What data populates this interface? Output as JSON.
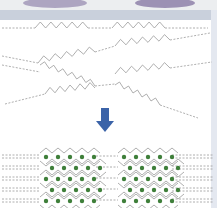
{
  "figure": {
    "title": "",
    "stages": [
      {
        "name": "amorphous-chains",
        "description": "disordered zigzag polymer chains"
      },
      {
        "name": "ordered-structure",
        "description": "aligned chains with crystalline domains"
      }
    ],
    "colors": {
      "chain": "#9a9a9a",
      "arrow": "#3b63a8",
      "dot": "#3f7f3a",
      "background": "#ffffff",
      "band": "#c9d0dc",
      "dish": "#7a6a9a"
    },
    "crystal_domains": 2,
    "dot_rows": 5
  }
}
